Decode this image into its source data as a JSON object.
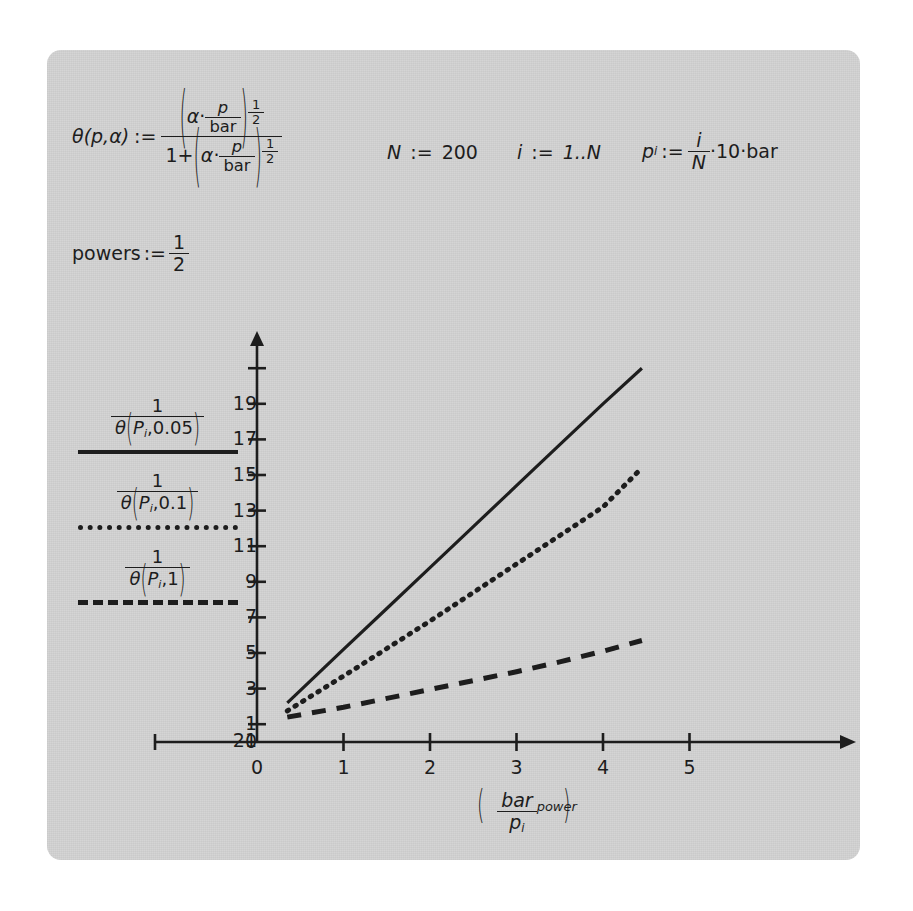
{
  "document": {
    "type": "mathcad-worksheet-plot",
    "background_color": "#d4d4d4",
    "ink_color": "#1d1d1d"
  },
  "definitions": {
    "theta": {
      "lhs": "θ(p,α)",
      "assign": ":=",
      "numerator": "(α · p/bar)^(1/2)",
      "denominator": "1 + (α · p/bar)^(1/2)",
      "alpha": "α",
      "p": "p",
      "bar": "bar",
      "exp_num": "1",
      "exp_den": "2",
      "one": "1",
      "plus": "+",
      "dot": "·"
    },
    "powers": {
      "lhs": "powers",
      "assign": ":=",
      "num": "1",
      "den": "2"
    },
    "N": {
      "lhs": "N",
      "assign": ":=",
      "value": "200"
    },
    "i": {
      "lhs": "i",
      "assign": ":=",
      "value": "1..N"
    },
    "p_i": {
      "lhs": "p",
      "sub": "i",
      "assign": ":=",
      "num": "i",
      "den": "N",
      "dot1": "·",
      "factor": "10",
      "dot2": "·",
      "unit": "bar"
    }
  },
  "legend": {
    "entries": [
      {
        "name": "theta-0p05",
        "num": "1",
        "theta": "θ",
        "p_sym": "P",
        "p_sub": "i",
        "comma": ",",
        "alpha": "0.05",
        "style": "solid"
      },
      {
        "name": "theta-0p1",
        "num": "1",
        "theta": "θ",
        "p_sym": "P",
        "p_sub": "i",
        "comma": ",",
        "alpha": "0.1",
        "style": "dotted"
      },
      {
        "name": "theta-1",
        "num": "1",
        "theta": "θ",
        "p_sym": "P",
        "p_sub": "i",
        "comma": ",",
        "alpha": "1",
        "style": "dashed"
      }
    ]
  },
  "chart_data": {
    "type": "line",
    "title": "",
    "xlabel": "(bar / p_i)^power",
    "ylabel": "",
    "xlim": [
      0,
      5.6
    ],
    "ylim": [
      0,
      22
    ],
    "grid": false,
    "legend_position": "left-outside",
    "xticks": [
      0,
      1,
      2,
      3,
      4,
      5
    ],
    "xtick_labels": [
      "0",
      "1",
      "2",
      "3",
      "4",
      "5"
    ],
    "yticks": [
      0,
      1,
      3,
      5,
      7,
      9,
      11,
      13,
      15,
      17,
      19,
      21
    ],
    "ytick_labels": [
      "0",
      "1",
      "3",
      "5",
      "7",
      "9",
      "11",
      "13",
      "15",
      "17",
      "19",
      "21"
    ],
    "series": [
      {
        "name": "1/θ(P_i,0.05)",
        "style": "solid",
        "color": "#1d1d1d",
        "x": [
          0.35,
          1.0,
          1.5,
          2.0,
          2.5,
          3.0,
          3.5,
          4.0,
          4.45
        ],
        "y": [
          2.2,
          5.2,
          7.5,
          9.8,
          12.1,
          14.4,
          16.7,
          19.0,
          21.0
        ]
      },
      {
        "name": "1/θ(P_i,0.1)",
        "style": "dotted",
        "color": "#1d1d1d",
        "x": [
          0.35,
          1.0,
          1.5,
          2.0,
          2.5,
          3.0,
          3.5,
          4.0,
          4.45
        ],
        "y": [
          1.75,
          3.7,
          5.25,
          6.8,
          8.4,
          10.0,
          11.6,
          13.2,
          15.4
        ]
      },
      {
        "name": "1/θ(P_i,1)",
        "style": "dashed",
        "color": "#1d1d1d",
        "x": [
          0.35,
          1.0,
          1.5,
          2.0,
          2.5,
          3.0,
          3.5,
          4.0,
          4.45
        ],
        "y": [
          1.4,
          1.95,
          2.45,
          2.95,
          3.45,
          3.95,
          4.5,
          5.1,
          5.7
        ]
      }
    ]
  },
  "axis_label": {
    "num": "bar",
    "den": "p",
    "den_sub": "i",
    "exponent": "power"
  }
}
